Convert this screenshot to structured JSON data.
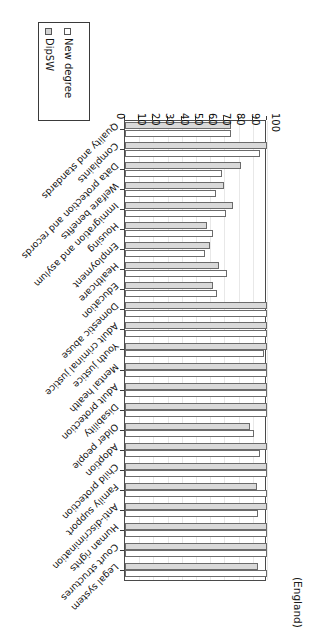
{
  "figure": {
    "caption": "(England)",
    "orientation_note": "chart rendered rotated 180 degrees"
  },
  "legend": {
    "position": "top-left-rotated",
    "items": [
      {
        "label": "New degree",
        "color": "#ffffff",
        "swatch": "legend-swatch-new-degree"
      },
      {
        "label": "DipSW",
        "color": "#d9d9d9",
        "swatch": "legend-swatch-dipsw"
      }
    ]
  },
  "chart_data": {
    "type": "bar",
    "title": "",
    "subtitle": "(England)",
    "xlabel": "",
    "ylabel": "",
    "ylim": [
      0,
      100
    ],
    "yticks": [
      0,
      10,
      20,
      30,
      40,
      50,
      60,
      70,
      80,
      90,
      100
    ],
    "ytick_labels": [
      "0",
      "10",
      "20",
      "30",
      "40",
      "50",
      "60",
      "70",
      "80",
      "90",
      "100"
    ],
    "grid": true,
    "legend_position": "outside-top-left",
    "orientation": "horizontal",
    "categories": [
      "Legal system",
      "Court structures",
      "Human rights",
      "Anti-discrimination",
      "Family support",
      "Child protection",
      "Adoption",
      "Older people",
      "Disability",
      "Adult protection",
      "Mental health",
      "Youth justice",
      "Adult criminal justice",
      "Domestic abuse",
      "Education",
      "Healthcare",
      "Employment",
      "Housing",
      "Immigration and asylum",
      "Welfare benefits",
      "Data protection and records",
      "Complaints",
      "Quality and standards"
    ],
    "series": [
      {
        "name": "New degree",
        "color": "#ffffff",
        "values": [
          100,
          100,
          100,
          94,
          100,
          100,
          95,
          91,
          100,
          100,
          100,
          98,
          100,
          100,
          65,
          72,
          56,
          62,
          71,
          64,
          68,
          95,
          75
        ]
      },
      {
        "name": "DipSW",
        "color": "#d9d9d9",
        "values": [
          94,
          100,
          100,
          100,
          93,
          100,
          100,
          88,
          100,
          100,
          100,
          100,
          100,
          100,
          62,
          66,
          60,
          58,
          76,
          70,
          82,
          100,
          75
        ]
      }
    ]
  }
}
